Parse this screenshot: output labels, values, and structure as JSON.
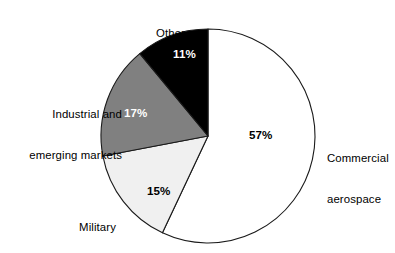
{
  "chart_data": {
    "type": "pie",
    "title": "",
    "subtitle": "",
    "xlabel": "",
    "ylabel": "",
    "legend_position": "none",
    "grid": false,
    "start_angle_deg": 0,
    "direction": "clockwise",
    "categories": [
      "Commercial aerospace",
      "Military",
      "Industrial and emerging markets",
      "Other"
    ],
    "values": [
      57,
      15,
      17,
      11
    ],
    "value_unit": "%",
    "data_labels": [
      "57%",
      "15%",
      "17%",
      "11%"
    ],
    "slice_colors": [
      "#ffffff",
      "#f0f0f0",
      "#808080",
      "#000000"
    ],
    "slice_label_colors": [
      "#000000",
      "#000000",
      "#ffffff",
      "#ffffff"
    ],
    "stroke_color": "#1a1a1a",
    "background_color": "#ffffff",
    "slices": [
      {
        "name": "Commercial aerospace",
        "label_line_1": "Commercial",
        "label_line_2": "aerospace",
        "value": 57,
        "percent_label": "57%",
        "fill": "#ffffff",
        "text_color": "#000000"
      },
      {
        "name": "Military",
        "label_line_1": "Military",
        "label_line_2": "",
        "value": 15,
        "percent_label": "15%",
        "fill": "#f0f0f0",
        "text_color": "#000000"
      },
      {
        "name": "Industrial and emerging markets",
        "label_line_1": "Industrial and",
        "label_line_2": "emerging markets",
        "value": 17,
        "percent_label": "17%",
        "fill": "#808080",
        "text_color": "#ffffff"
      },
      {
        "name": "Other",
        "label_line_1": "Other",
        "label_line_2": "",
        "value": 11,
        "percent_label": "11%",
        "fill": "#000000",
        "text_color": "#ffffff"
      }
    ]
  },
  "labels": {
    "other": "Other",
    "industrial_line1": "Industrial and",
    "industrial_line2": "emerging markets",
    "military": "Military",
    "commercial_line1": "Commercial",
    "commercial_line2": "aerospace"
  },
  "percents": {
    "commercial": "57%",
    "military": "15%",
    "industrial": "17%",
    "other": "11%"
  }
}
